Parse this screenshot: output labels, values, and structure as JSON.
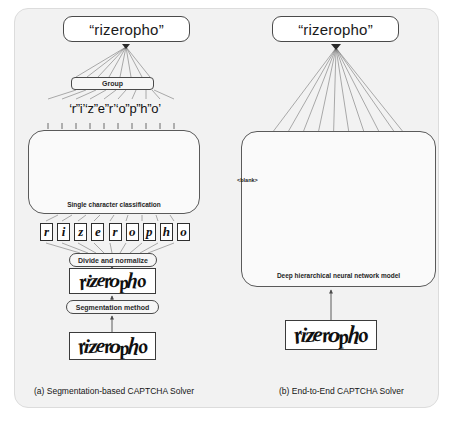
{
  "figure": {
    "title_internal": "Comparison of CAPTCHA solving architectures",
    "colors": {
      "panel_background": "#f2f2f2",
      "page_background": "#ffffff",
      "box_border": "#4a4a4a",
      "node_fill": "#a8a8a8",
      "node_stroke": "#6e6e6e",
      "edge_line": "#5a5a5a",
      "conv_dark": "#595959",
      "conv_mid": "#8c8c8c",
      "conv_light": "#bdbdbd"
    }
  },
  "panel_a": {
    "output_label": "“rizeropho”",
    "group_label": "Group",
    "character_string": "‘r”i’‘z”e”r’‘o”p”h”o’",
    "model_caption": "Single character classification",
    "segmented_glyphs": [
      "r",
      "i",
      "z",
      "e",
      "r",
      "o",
      "p",
      "h",
      "o"
    ],
    "divide_label": "Divide and normalize",
    "segmentation_label": "Segmentation method",
    "captcha_normalized": "rizeropho",
    "captcha_raw": "rizeropho",
    "figure_caption": "(a) Segmentation-based CAPTCHA Solver"
  },
  "panel_b": {
    "output_label": "“rizeropho”",
    "blank_label": "<blank>",
    "node_count": 10,
    "model_caption": "Deep hierarchical neural network model",
    "captcha_raw": "rizeropho",
    "figure_caption": "(b) End-to-End CAPTCHA Solver"
  }
}
